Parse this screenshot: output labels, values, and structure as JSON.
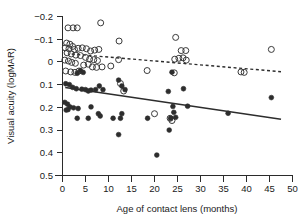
{
  "chart_data": {
    "type": "scatter",
    "title": "",
    "xlabel": "Age of contact lens (months)",
    "ylabel": "Visual acuity (logMAR)",
    "xlim": [
      0,
      50
    ],
    "ylim": [
      -0.2,
      0.5
    ],
    "y_axis_inverted": true,
    "grid": false,
    "legend_position": "none",
    "xticks": [
      0,
      5,
      10,
      15,
      20,
      25,
      30,
      35,
      40,
      45,
      50
    ],
    "xtick_labels": [
      "0",
      "5",
      "10",
      "15",
      "20",
      "25",
      "30",
      "35",
      "40",
      "45",
      "50"
    ],
    "yticks": [
      -0.2,
      -0.1,
      0,
      0.1,
      0.2,
      0.3,
      0.4,
      0.5
    ],
    "ytick_labels": [
      "−0.2",
      "−0.1",
      "0",
      "0.1",
      "0.2",
      "0.3",
      "0.4",
      "0.5"
    ],
    "series": [
      {
        "name": "open-circles",
        "marker": "open-circle",
        "color": "#3a3a3a",
        "points": [
          [
            1.2,
            -0.15
          ],
          [
            2.3,
            -0.15
          ],
          [
            3.2,
            -0.15
          ],
          [
            8.3,
            -0.172
          ],
          [
            0.9,
            -0.083
          ],
          [
            1.6,
            -0.078
          ],
          [
            2.2,
            -0.068
          ],
          [
            0.6,
            -0.062
          ],
          [
            1.4,
            -0.058
          ],
          [
            2.6,
            -0.055
          ],
          [
            3.4,
            -0.06
          ],
          [
            4.3,
            -0.062
          ],
          [
            5.2,
            -0.058
          ],
          [
            6.1,
            -0.048
          ],
          [
            7.0,
            -0.052
          ],
          [
            7.9,
            -0.055
          ],
          [
            12.3,
            -0.092
          ],
          [
            1.0,
            -0.04
          ],
          [
            1.9,
            -0.035
          ],
          [
            2.9,
            -0.03
          ],
          [
            3.9,
            -0.028
          ],
          [
            5.0,
            -0.02
          ],
          [
            5.9,
            -0.012
          ],
          [
            6.8,
            -0.01
          ],
          [
            7.6,
            -0.006
          ],
          [
            0.5,
            -0.008
          ],
          [
            1.3,
            -0.004
          ],
          [
            2.0,
            0.002
          ],
          [
            2.8,
            0.006
          ],
          [
            4.6,
            0.014
          ],
          [
            5.6,
            0.01
          ],
          [
            6.5,
            0.022
          ],
          [
            7.4,
            0.024
          ],
          [
            8.6,
            0.022
          ],
          [
            12.2,
            -0.01
          ],
          [
            10.5,
            0.018
          ],
          [
            18.4,
            0.038
          ],
          [
            24.6,
            -0.108
          ],
          [
            25.8,
            -0.05
          ],
          [
            26.8,
            -0.05
          ],
          [
            26.9,
            -0.008
          ],
          [
            24.4,
            -0.012
          ],
          [
            25.3,
            -0.016
          ],
          [
            26.2,
            -0.018
          ],
          [
            24.3,
            0.048
          ],
          [
            0.7,
            0.04
          ],
          [
            1.8,
            0.044
          ],
          [
            2.7,
            0.046
          ],
          [
            3.6,
            0.04
          ],
          [
            12.6,
            0.095
          ],
          [
            13.3,
            0.128
          ],
          [
            20.0,
            0.228
          ],
          [
            23.4,
            0.248
          ],
          [
            23.8,
            0.258
          ],
          [
            38.8,
            0.044
          ],
          [
            39.5,
            0.046
          ],
          [
            45.4,
            -0.055
          ]
        ]
      },
      {
        "name": "filled-circles",
        "marker": "filled-circle",
        "color": "#2d2d2d",
        "points": [
          [
            3.9,
            0.038
          ],
          [
            4.5,
            0.046
          ],
          [
            3.2,
            0.05
          ],
          [
            0.7,
            0.096
          ],
          [
            1.5,
            0.1
          ],
          [
            2.2,
            0.112
          ],
          [
            3.0,
            0.118
          ],
          [
            4.2,
            0.12
          ],
          [
            5.0,
            0.122
          ],
          [
            5.6,
            0.128
          ],
          [
            6.2,
            0.124
          ],
          [
            7.2,
            0.122
          ],
          [
            8.0,
            0.106
          ],
          [
            8.8,
            0.122
          ],
          [
            12.2,
            0.08
          ],
          [
            12.9,
            0.106
          ],
          [
            13.6,
            0.122
          ],
          [
            0.5,
            0.178
          ],
          [
            1.1,
            0.186
          ],
          [
            1.6,
            0.198
          ],
          [
            1.2,
            0.21
          ],
          [
            0.8,
            0.212
          ],
          [
            2.4,
            0.202
          ],
          [
            3.4,
            0.205
          ],
          [
            6.2,
            0.198
          ],
          [
            7.8,
            0.228
          ],
          [
            3.2,
            0.248
          ],
          [
            5.6,
            0.248
          ],
          [
            8.2,
            0.238
          ],
          [
            11.0,
            0.248
          ],
          [
            12.6,
            0.248
          ],
          [
            12.9,
            0.228
          ],
          [
            18.5,
            0.248
          ],
          [
            20.5,
            0.41
          ],
          [
            23.0,
            0.13
          ],
          [
            23.2,
            0.3
          ],
          [
            23.5,
            0.248
          ],
          [
            24.0,
            0.196
          ],
          [
            24.2,
            0.222
          ],
          [
            24.6,
            0.244
          ],
          [
            23.8,
            0.045
          ],
          [
            26.3,
            0.118
          ],
          [
            27.2,
            0.195
          ],
          [
            12.2,
            0.32
          ],
          [
            36.0,
            0.226
          ],
          [
            45.4,
            0.157
          ]
        ]
      }
    ],
    "fit_lines": [
      {
        "name": "open-circles-fit",
        "style": "dashed",
        "x0": 2.0,
        "y0": -0.035,
        "x1": 47.5,
        "y1": 0.043
      },
      {
        "name": "filled-circles-fit",
        "style": "solid",
        "x0": 0.6,
        "y0": 0.113,
        "x1": 47.5,
        "y1": 0.252
      }
    ]
  }
}
